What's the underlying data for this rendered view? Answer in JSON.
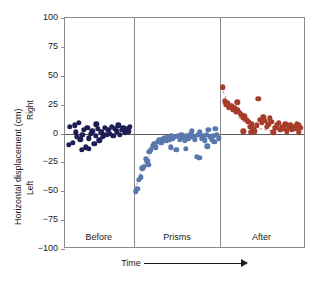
{
  "chart_data": {
    "type": "scatter",
    "title": "",
    "xlabel": "Time",
    "ylabel": "Horizontal displacement (cm)",
    "ylim": [
      -100,
      100
    ],
    "yticks": [
      100,
      75,
      50,
      25,
      0,
      -25,
      -50,
      -75,
      -100
    ],
    "ytick_labels": [
      "100",
      "75",
      "50",
      "25",
      "0",
      "−25",
      "−50",
      "−75",
      "−100"
    ],
    "grid": false,
    "legend": "none",
    "axis_direction_labels": {
      "positive": "Right",
      "negative": "Left"
    },
    "xaxis_arrow": true,
    "zero_reference_line": true,
    "panels": [
      {
        "label": "Before",
        "color": "#1e1e55",
        "x_range": [
          0,
          28
        ],
        "description": "Baseline pointing, clustered near zero",
        "points": [
          [
            2.0,
            6
          ],
          [
            3.2,
            -8
          ],
          [
            4.4,
            1
          ],
          [
            5.0,
            -3
          ],
          [
            5.8,
            9
          ],
          [
            6.4,
            -5
          ],
          [
            7.2,
            -1
          ],
          [
            7.9,
            3
          ],
          [
            8.6,
            -12
          ],
          [
            9.3,
            5
          ],
          [
            10.0,
            -4
          ],
          [
            10.7,
            0
          ],
          [
            11.4,
            2
          ],
          [
            12.1,
            -9
          ],
          [
            12.8,
            -2
          ],
          [
            13.6,
            4
          ],
          [
            14.3,
            -6
          ],
          [
            15.0,
            1
          ],
          [
            15.8,
            -3
          ],
          [
            16.5,
            5
          ],
          [
            17.2,
            -1
          ],
          [
            17.9,
            3
          ],
          [
            18.6,
            0
          ],
          [
            19.3,
            6
          ],
          [
            20.0,
            -2
          ],
          [
            20.7,
            4
          ],
          [
            21.4,
            2
          ],
          [
            22.1,
            7
          ],
          [
            22.8,
            -1
          ],
          [
            23.5,
            3
          ],
          [
            24.2,
            5
          ],
          [
            24.9,
            1
          ],
          [
            25.6,
            4
          ],
          [
            26.3,
            2
          ],
          [
            27.0,
            6
          ],
          [
            1.5,
            -10
          ],
          [
            6.9,
            -14
          ],
          [
            9.9,
            -13
          ],
          [
            4.0,
            7
          ],
          [
            13.0,
            8
          ]
        ]
      },
      {
        "label": "Prisms",
        "color": "#5a78ad",
        "x_range": [
          29,
          64
        ],
        "description": "Large leftward error on first trials, then rapid adaptation back toward zero",
        "points": [
          [
            29.4,
            -50
          ],
          [
            30.0,
            -48
          ],
          [
            30.7,
            -40
          ],
          [
            31.4,
            -38
          ],
          [
            32.1,
            -30
          ],
          [
            32.8,
            -29
          ],
          [
            33.5,
            -22
          ],
          [
            34.2,
            -24
          ],
          [
            35.0,
            -16
          ],
          [
            35.7,
            -14
          ],
          [
            36.4,
            -11
          ],
          [
            37.1,
            -9
          ],
          [
            37.8,
            -12
          ],
          [
            38.5,
            -7
          ],
          [
            39.2,
            -6
          ],
          [
            39.9,
            -8
          ],
          [
            40.6,
            -5
          ],
          [
            41.3,
            -4
          ],
          [
            42.0,
            -6
          ],
          [
            42.7,
            -3
          ],
          [
            43.4,
            -5
          ],
          [
            44.1,
            -2
          ],
          [
            44.8,
            -4
          ],
          [
            45.5,
            -3
          ],
          [
            46.2,
            -14
          ],
          [
            46.9,
            -2
          ],
          [
            47.6,
            -5
          ],
          [
            48.3,
            -1
          ],
          [
            49.0,
            -3
          ],
          [
            49.7,
            -6
          ],
          [
            50.4,
            -2
          ],
          [
            51.1,
            -4
          ],
          [
            51.8,
            -1
          ],
          [
            52.5,
            2
          ],
          [
            53.2,
            -3
          ],
          [
            53.9,
            -5
          ],
          [
            54.6,
            -20
          ],
          [
            55.3,
            -1
          ],
          [
            56.0,
            1
          ],
          [
            56.7,
            -4
          ],
          [
            57.4,
            -2
          ],
          [
            58.1,
            -6
          ],
          [
            58.8,
            -1
          ],
          [
            59.5,
            3
          ],
          [
            60.2,
            -3
          ],
          [
            60.9,
            -5
          ],
          [
            61.6,
            -2
          ],
          [
            62.3,
            4
          ],
          [
            63.0,
            -1
          ],
          [
            63.7,
            -4
          ],
          [
            34.6,
            -27
          ],
          [
            43.8,
            -12
          ],
          [
            50.0,
            -13
          ],
          [
            55.8,
            -21
          ],
          [
            59.0,
            -11
          ],
          [
            62.0,
            -7
          ]
        ]
      },
      {
        "label": "After",
        "color": "#a83c2b",
        "x_range": [
          65,
          98
        ],
        "description": "Rightward aftereffect that decays back toward zero",
        "points": [
          [
            65.5,
            40
          ],
          [
            66.2,
            28
          ],
          [
            66.9,
            25
          ],
          [
            67.6,
            26
          ],
          [
            68.3,
            23
          ],
          [
            69.0,
            24
          ],
          [
            69.7,
            21
          ],
          [
            70.4,
            22
          ],
          [
            71.1,
            19
          ],
          [
            71.8,
            20
          ],
          [
            72.5,
            18
          ],
          [
            73.2,
            16
          ],
          [
            73.9,
            14
          ],
          [
            74.6,
            15
          ],
          [
            75.3,
            12
          ],
          [
            76.0,
            10
          ],
          [
            76.7,
            6
          ],
          [
            77.4,
            8
          ],
          [
            78.1,
            4
          ],
          [
            78.8,
            2
          ],
          [
            79.5,
            7
          ],
          [
            80.2,
            30
          ],
          [
            80.9,
            12
          ],
          [
            81.6,
            9
          ],
          [
            82.3,
            14
          ],
          [
            83.0,
            11
          ],
          [
            83.7,
            6
          ],
          [
            84.4,
            8
          ],
          [
            85.1,
            13
          ],
          [
            85.8,
            10
          ],
          [
            86.5,
            1
          ],
          [
            87.2,
            5
          ],
          [
            87.9,
            7
          ],
          [
            88.6,
            9
          ],
          [
            89.3,
            3
          ],
          [
            90.0,
            6
          ],
          [
            90.7,
            4
          ],
          [
            91.4,
            8
          ],
          [
            92.1,
            2
          ],
          [
            92.8,
            5
          ],
          [
            93.5,
            7
          ],
          [
            94.2,
            3
          ],
          [
            94.9,
            6
          ],
          [
            95.6,
            4
          ],
          [
            96.3,
            8
          ],
          [
            97.0,
            1
          ],
          [
            97.7,
            5
          ],
          [
            74.0,
            2
          ],
          [
            77.0,
            1
          ],
          [
            71.5,
            27
          ],
          [
            68.0,
            22
          ],
          [
            96.8,
            7
          ]
        ]
      }
    ]
  }
}
